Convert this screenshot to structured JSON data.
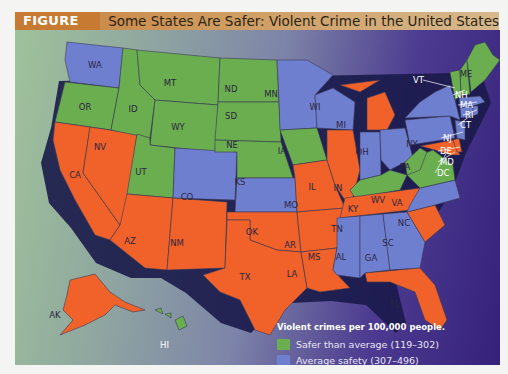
{
  "header": {
    "figure_label": "FIGURE 6.1",
    "title": "Some States Are Safer: Violent Crime in the United States"
  },
  "colors": {
    "safer": "#6aae4f",
    "average": "#6f7fd0",
    "dangerous": "#f0622a",
    "title_bar": "#c8823e",
    "ocean_dark": "#36217a"
  },
  "legend": {
    "title": "Violent crimes per 100,000 people.",
    "items": [
      {
        "label": "Safer than average (119–302)",
        "category": "safer",
        "color": "#6aae4f"
      },
      {
        "label": "Average safety (307–496)",
        "category": "average",
        "color": "#6f7fd0"
      },
      {
        "label": "More dangerous than average (504–728)",
        "category": "dangerous",
        "color": "#f0622a"
      }
    ]
  },
  "states": {
    "WA": "average",
    "OR": "safer",
    "CA": "dangerous",
    "NV": "dangerous",
    "ID": "safer",
    "MT": "safer",
    "WY": "safer",
    "UT": "safer",
    "AZ": "dangerous",
    "CO": "average",
    "NM": "dangerous",
    "ND": "safer",
    "SD": "safer",
    "NE": "safer",
    "KS": "average",
    "OK": "dangerous",
    "TX": "dangerous",
    "MN": "average",
    "IA": "safer",
    "MO": "dangerous",
    "AR": "dangerous",
    "LA": "dangerous",
    "WI": "average",
    "IL": "dangerous",
    "MI": "dangerous",
    "IN": "average",
    "OH": "average",
    "KY": "safer",
    "TN": "dangerous",
    "MS": "average",
    "AL": "average",
    "GA": "average",
    "FL": "dangerous",
    "SC": "dangerous",
    "NC": "average",
    "VA": "safer",
    "WV": "safer",
    "PA": "average",
    "NY": "average",
    "VT": "safer",
    "NH": "safer",
    "ME": "safer",
    "MA": "average",
    "RI": "average",
    "CT": "average",
    "NJ": "average",
    "DE": "dangerous",
    "MD": "dangerous",
    "DC": "dangerous",
    "AK": "dangerous",
    "HI": "safer"
  },
  "labels": {
    "WA": "WA",
    "OR": "OR",
    "CA": "CA",
    "NV": "NV",
    "ID": "ID",
    "MT": "MT",
    "WY": "WY",
    "UT": "UT",
    "AZ": "AZ",
    "CO": "CO",
    "NM": "NM",
    "ND": "ND",
    "SD": "SD",
    "NE": "NE",
    "KS": "KS",
    "OK": "OK",
    "TX": "TX",
    "MN": "MN",
    "IA": "IA",
    "MO": "MO",
    "AR": "AR",
    "LA": "LA",
    "WI": "WI",
    "IL": "IL",
    "MI": "MI",
    "IN": "IN",
    "OH": "OH",
    "KY": "KY",
    "TN": "TN",
    "MS": "MS",
    "AL": "AL",
    "GA": "GA",
    "FL": "FL",
    "SC": "SC",
    "NC": "NC",
    "VA": "VA",
    "WV": "WV",
    "PA": "PA",
    "NY": "NY",
    "VT": "VT",
    "NH": "NH",
    "ME": "ME",
    "MA": "MA",
    "RI": "RI",
    "CT": "CT",
    "NJ": "NJ",
    "DE": "DE",
    "MD": "MD",
    "DC": "DC",
    "AK": "AK",
    "HI": "HI"
  }
}
